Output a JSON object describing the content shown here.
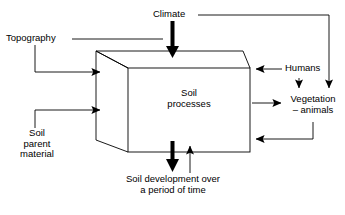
{
  "figure": {
    "type": "flow-diagram",
    "stroke_color": "#000000",
    "background_color": "#ffffff"
  },
  "labels": {
    "climate": "Climate",
    "topography": "Topography",
    "soil_parent_material_line1": "Soil",
    "soil_parent_material_line2": "parent",
    "soil_parent_material_line3": "material",
    "box_line1": "Soil",
    "box_line2": "processes",
    "humans": "Humans",
    "vegetation_line1": "Vegetation",
    "vegetation_line2": "– animals",
    "soil_development_line1": "Soil development over",
    "soil_development_line2": "a period of time"
  },
  "nodes": [
    {
      "id": "climate",
      "label": "Climate",
      "role": "input-factor"
    },
    {
      "id": "topography",
      "label": "Topography",
      "role": "input-factor"
    },
    {
      "id": "soil-parent-material",
      "label": "Soil parent material",
      "role": "input-factor"
    },
    {
      "id": "soil-processes",
      "label": "Soil processes",
      "role": "central-process-box"
    },
    {
      "id": "humans",
      "label": "Humans",
      "role": "input-factor"
    },
    {
      "id": "vegetation-animals",
      "label": "Vegetation – animals",
      "role": "output-and-feedback"
    },
    {
      "id": "soil-development",
      "label": "Soil development over a period of time",
      "role": "output"
    }
  ],
  "connections": [
    {
      "from": "climate",
      "to": "soil-processes",
      "style": "thick-arrow-down"
    },
    {
      "from": "climate",
      "to": "vegetation-animals",
      "style": "thin-arrow-down-right-path"
    },
    {
      "from": "topography",
      "to": "soil-processes",
      "style": "thin-arrow-right"
    },
    {
      "from": "soil-parent-material",
      "to": "soil-processes",
      "style": "thin-arrow-right"
    },
    {
      "from": "humans",
      "to": "soil-processes",
      "style": "thin-arrow-left"
    },
    {
      "from": "humans",
      "to": "vegetation-animals",
      "style": "thin-arrow-down"
    },
    {
      "from": "soil-processes",
      "to": "vegetation-animals",
      "style": "thin-arrow-right"
    },
    {
      "from": "vegetation-animals",
      "to": "soil-processes",
      "style": "thin-arrow-left-feedback"
    },
    {
      "from": "soil-processes",
      "to": "soil-development",
      "style": "thick-arrow-down"
    },
    {
      "from": "soil-development",
      "to": "soil-processes",
      "style": "thin-arrow-up-feedback"
    }
  ]
}
